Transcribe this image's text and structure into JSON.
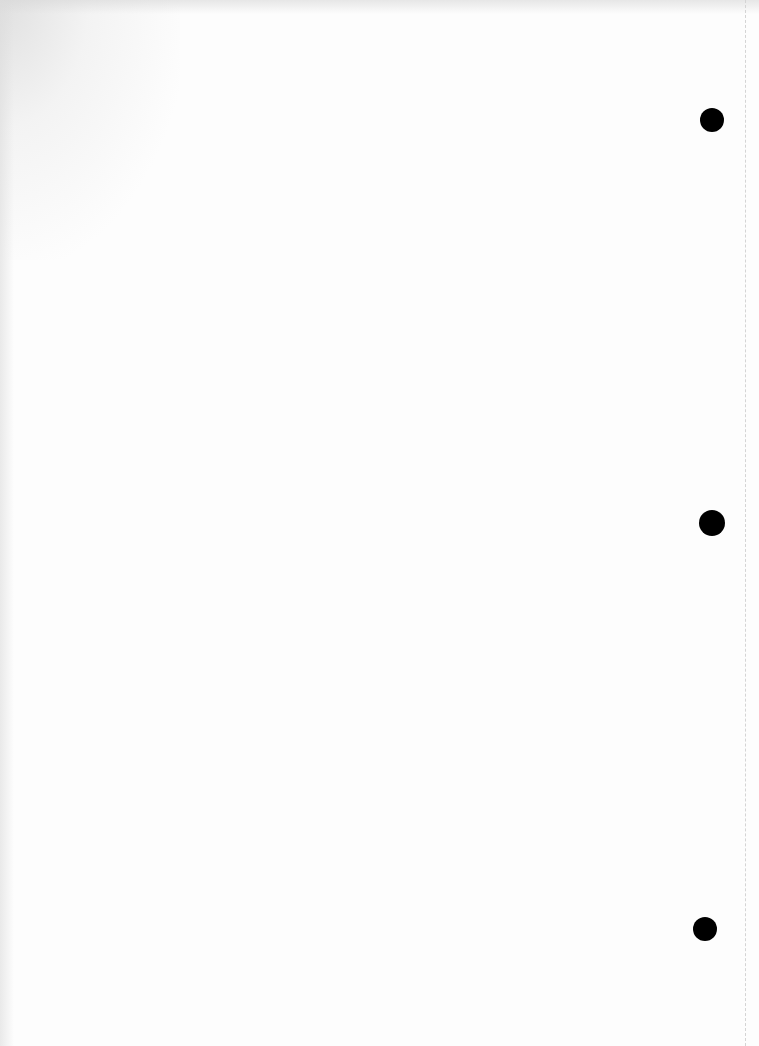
{
  "page": {
    "type": "blank scanned page",
    "background": "#fdfdfd",
    "punch_holes": [
      {
        "cx": 712,
        "cy": 120,
        "r": 12
      },
      {
        "cx": 712,
        "cy": 523,
        "r": 13
      },
      {
        "cx": 705,
        "cy": 929,
        "r": 12
      }
    ],
    "hole_color": "#000000",
    "margin_line_color": "#d4d4d4"
  }
}
